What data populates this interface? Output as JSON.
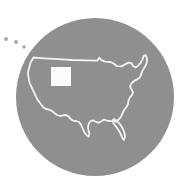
{
  "graphic": {
    "title": "United States map icon",
    "description": "Gray circular badge containing a white outline map of the contiguous United States with one state highlighted in solid white, plus three small dots outside the circle at the upper left.",
    "canvas": {
      "width": 181,
      "height": 187,
      "background_color": "#ffffff"
    },
    "circle": {
      "name": "circle-badge",
      "center_x": 95,
      "center_y": 97,
      "radius": 79,
      "fill_color": "#8f8f8f"
    },
    "map_outline": {
      "name": "usa-outline",
      "label": "Contiguous United States",
      "stroke_color": "#f2f2f2",
      "stroke_width": 1.8,
      "fill": "none"
    },
    "highlighted_state": {
      "name": "highlighted-state",
      "label": "Colorado",
      "fill_color": "#fbfbfb",
      "x": 51,
      "y": 67,
      "width": 20,
      "height": 19
    },
    "dots": {
      "name": "island-dots",
      "label": "Island markers",
      "fill_color": "#a9a9a9",
      "items": [
        {
          "cx": 6,
          "cy": 39,
          "r": 2.0
        },
        {
          "cx": 16,
          "cy": 42,
          "r": 2.0
        },
        {
          "cx": 24,
          "cy": 47,
          "r": 1.8
        }
      ]
    }
  }
}
